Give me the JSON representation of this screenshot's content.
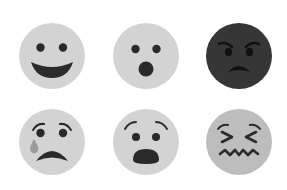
{
  "colors": {
    "background": "#ffffff",
    "face_light": "#d3d3d3",
    "face_dark": "#363636",
    "face_mid": "#bdbdbd",
    "feature_dark": "#2a2a2a",
    "feature_on_dark": "#111111",
    "tear": "#9a9a9a"
  },
  "faces": [
    {
      "name": "happy-face",
      "label": "Happy",
      "row": 0,
      "col": 0
    },
    {
      "name": "surprised-face",
      "label": "Surprised",
      "row": 0,
      "col": 1
    },
    {
      "name": "angry-face",
      "label": "Angry",
      "row": 0,
      "col": 2
    },
    {
      "name": "crying-face",
      "label": "Crying",
      "row": 1,
      "col": 0
    },
    {
      "name": "shocked-face",
      "label": "Shocked",
      "row": 1,
      "col": 1
    },
    {
      "name": "confounded-face",
      "label": "Confounded",
      "row": 1,
      "col": 2
    }
  ]
}
